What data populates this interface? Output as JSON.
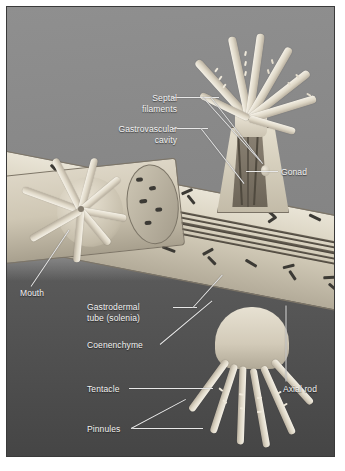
{
  "figure": {
    "frame_border_color": "#3a3a3a",
    "background_upper_color": "#8b8b8b",
    "background_lower_color": "#4e4e4e",
    "label_text_color": "#f2f2f2",
    "leader_line_color": "#e8e8e8",
    "tissue_color": "#ded7c6",
    "sclerite_color": "#3c3a35"
  },
  "labels": [
    {
      "id": "septal-filaments",
      "text": "Septal\nfilaments",
      "align": "right",
      "x": 88,
      "y": 86,
      "width": 82
    },
    {
      "id": "gastrovascular-cavity",
      "text": "Gastrovascular\ncavity",
      "align": "right",
      "x": 72,
      "y": 118,
      "width": 98
    },
    {
      "id": "gonad",
      "text": "Gonad",
      "align": "left",
      "x": 274,
      "y": 160,
      "width": 50
    },
    {
      "id": "mouth",
      "text": "Mouth",
      "align": "left",
      "x": 13,
      "y": 281,
      "width": 50
    },
    {
      "id": "gastrodermal-tube",
      "text": "Gastrodermal\ntube (solenia)",
      "align": "left",
      "x": 80,
      "y": 296,
      "width": 92
    },
    {
      "id": "coenenchyme",
      "text": "Coenenchyme",
      "align": "left",
      "x": 80,
      "y": 333,
      "width": 80
    },
    {
      "id": "tentacle",
      "text": "Tentacle",
      "align": "left",
      "x": 80,
      "y": 377,
      "width": 52
    },
    {
      "id": "pinnules",
      "text": "Pinnules",
      "align": "left",
      "x": 80,
      "y": 417,
      "width": 52
    },
    {
      "id": "axial-rod",
      "text": "Axial rod",
      "align": "left",
      "x": 276,
      "y": 377,
      "width": 56
    }
  ],
  "anatomy_parts": [
    "Septal filaments",
    "Gastrovascular cavity",
    "Gonad",
    "Mouth",
    "Gastrodermal tube (solenia)",
    "Coenenchyme",
    "Tentacle",
    "Pinnules",
    "Axial rod"
  ],
  "polyps": [
    {
      "id": "upper-right-polyp",
      "view": "cut-away, expanded",
      "tentacle_count": 8
    },
    {
      "id": "left-polyp",
      "view": "oral disc face-on",
      "tentacle_count": 8
    },
    {
      "id": "lower-polyp",
      "view": "hanging, expanded",
      "tentacle_count": 6
    }
  ]
}
